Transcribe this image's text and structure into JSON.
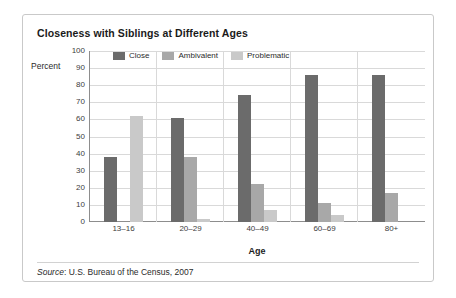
{
  "figure": {
    "title": "Closeness with Siblings at Different Ages",
    "source_word": "Source",
    "source_text": ": U.S. Bureau of the Census, 2007"
  },
  "colors": {
    "close": "#6b6b6b",
    "ambivalent": "#a8a8a8",
    "problematic": "#c9c9c9",
    "axis": "#8d8d8d",
    "grid": "#d9d9d9",
    "frame": "#c9c9c9",
    "text": "#2b2b2b"
  },
  "chart_data": {
    "type": "bar",
    "title": "Closeness with Siblings at Different Ages",
    "xlabel": "Age",
    "ylabel": "Percent",
    "ylim": [
      0,
      100
    ],
    "yticks": [
      0,
      10,
      20,
      30,
      40,
      50,
      60,
      70,
      80,
      90,
      100
    ],
    "grid": true,
    "legend_position": "top-left-inside",
    "categories": [
      "13–16",
      "20–29",
      "40–49",
      "60–69",
      "80+"
    ],
    "series": [
      {
        "name": "Close",
        "color": "#6b6b6b",
        "values": [
          38,
          61,
          74,
          86,
          86
        ]
      },
      {
        "name": "Ambivalent",
        "color": "#a8a8a8",
        "values": [
          0,
          38,
          22,
          11,
          17
        ]
      },
      {
        "name": "Problematic",
        "color": "#c9c9c9",
        "values": [
          62,
          2,
          7,
          4,
          0
        ]
      }
    ]
  }
}
